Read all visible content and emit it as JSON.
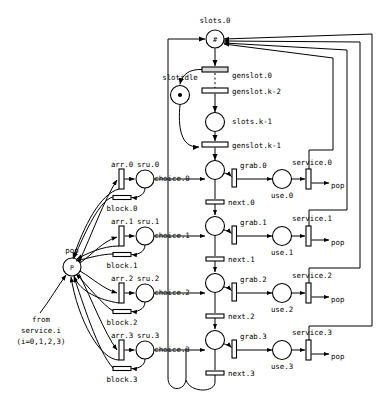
{
  "diagram": {
    "kind": "petri-net",
    "colors": {
      "stroke": "#000000",
      "background": "#ffffff",
      "transition_fill": "#d8d8d8"
    }
  },
  "labels": {
    "slots_0": "slots.0",
    "genslot_0": "genslot.0",
    "slotidle": "slotidle",
    "genslot_k2": "genslot.k-2",
    "slots_k1": "slots.k-1",
    "genslot_k1": "genslot.k-1",
    "pop_left": "pop",
    "from_service": "from",
    "from_service2": "service.i",
    "from_service3": "(i=0,1,2,3)"
  },
  "rows": [
    {
      "index": 0,
      "arr": "arr.0",
      "sru": "sru.0",
      "block": "block.0",
      "choice": "choice.0",
      "grab": "grab.0",
      "next": "next.0",
      "use": "use.0",
      "service": "service.0",
      "pop": "pop"
    },
    {
      "index": 1,
      "arr": "arr.1",
      "sru": "sru.1",
      "block": "block.1",
      "choice": "choice.1",
      "grab": "grab.1",
      "next": "next.1",
      "use": "use.1",
      "service": "service.1",
      "pop": "pop"
    },
    {
      "index": 2,
      "arr": "arr.2",
      "sru": "sru.2",
      "block": "block.2",
      "choice": "choice.2",
      "grab": "grab.2",
      "next": "next.2",
      "use": "use.2",
      "service": "service.2",
      "pop": "pop"
    },
    {
      "index": 3,
      "arr": "arr.3",
      "sru": "sru.3",
      "block": "block.3",
      "choice": "choice.3",
      "grab": "grab.3",
      "next": "next.3",
      "use": "use.3",
      "service": "service.3",
      "pop": "pop"
    }
  ],
  "places": [
    {
      "name": "slots.0",
      "tokens": 1,
      "marking_glyph": "#"
    },
    {
      "name": "slotidle",
      "tokens": 1,
      "marking_glyph": "dot"
    },
    {
      "name": "slots.k-1",
      "tokens": 0,
      "marking_glyph": ""
    },
    {
      "name": "P",
      "tokens": 0,
      "marking_glyph": "P"
    }
  ],
  "pool": {
    "label": "P"
  }
}
